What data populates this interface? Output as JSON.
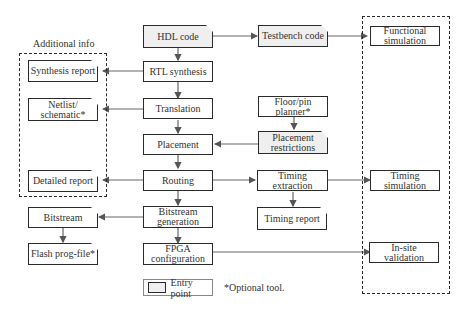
{
  "diagram": {
    "group_labels": {
      "additional_info": "Additional info"
    },
    "nodes": {
      "hdl_code": "HDL code",
      "testbench_code": "Testbench code",
      "functional_simulation": "Functional simulation",
      "rtl_synthesis": "RTL synthesis",
      "synthesis_report": "Synthesis report",
      "translation": "Translation",
      "netlist_schematic": "Netlist/ schematic*",
      "floor_pin_planner": "Floor/pin planner*",
      "placement": "Placement",
      "placement_restrictions": "Placement restrictions",
      "routing": "Routing",
      "detailed_report": "Detailed report",
      "timing_extraction": "Timing extraction",
      "timing_simulation": "Timing simulation",
      "timing_report": "Timing report",
      "bitstream": "Bitstream",
      "bitstream_generation": "Bitstream generation",
      "flash_prog_file": "Flash prog-file*",
      "fpga_configuration": "FPGA configuration",
      "in_site_validation": "In-site validation"
    },
    "legend": {
      "entry_point": "Entry point",
      "optional_tool": "*Optional tool."
    },
    "colors": {
      "entry_fill": "#efefef",
      "line": "#555555",
      "border": "#2a2a2a"
    }
  }
}
